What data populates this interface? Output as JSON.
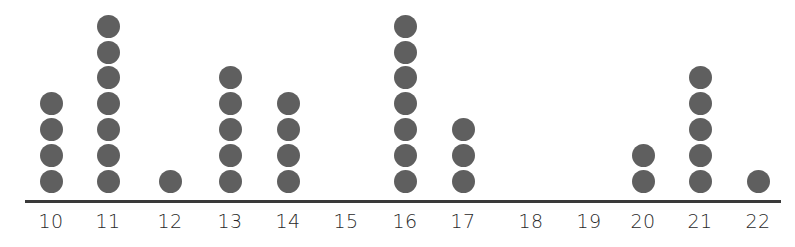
{
  "chart_data": {
    "type": "dot_plot",
    "title": "",
    "xlabel": "",
    "ylabel": "",
    "categories": [
      "10",
      "11",
      "12",
      "13",
      "14",
      "15",
      "16",
      "17",
      "18",
      "19",
      "20",
      "21",
      "22"
    ],
    "values": [
      4,
      7,
      1,
      5,
      4,
      0,
      7,
      3,
      0,
      0,
      2,
      5,
      1
    ],
    "x_positions": [
      51,
      108,
      170,
      230,
      288,
      346,
      405,
      463,
      531,
      589,
      643,
      700,
      758
    ],
    "grid": false,
    "legend": null,
    "dot_color": "#5f5f5f",
    "axis_color": "#3a3a3a"
  }
}
